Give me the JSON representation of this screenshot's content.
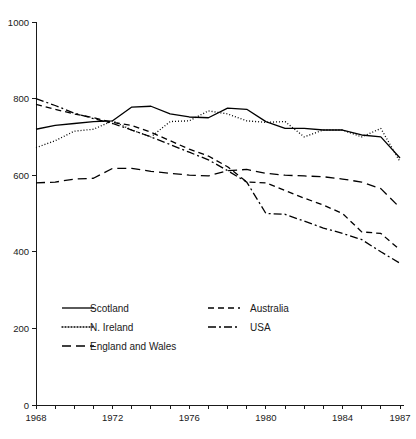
{
  "chart_data": {
    "type": "line",
    "title": "",
    "xlabel": "",
    "ylabel": "",
    "xlim": [
      1968,
      1987
    ],
    "ylim": [
      0,
      1000
    ],
    "grid": false,
    "legend_position": "inside-bottom-left",
    "x": [
      1968,
      1969,
      1970,
      1971,
      1972,
      1973,
      1974,
      1975,
      1976,
      1977,
      1978,
      1979,
      1980,
      1981,
      1982,
      1983,
      1984,
      1985,
      1986,
      1987
    ],
    "xticks": [
      1968,
      1969,
      1970,
      1971,
      1972,
      1973,
      1974,
      1975,
      1976,
      1977,
      1978,
      1979,
      1980,
      1981,
      1982,
      1983,
      1984,
      1985,
      1986,
      1987
    ],
    "xtick_labels": [
      "1968",
      "",
      "",
      "",
      "1972",
      "",
      "",
      "",
      "1976",
      "",
      "",
      "",
      "1980",
      "",
      "",
      "",
      "1984",
      "",
      "",
      "1987"
    ],
    "yticks": [
      0,
      200,
      400,
      600,
      800,
      1000
    ],
    "ytick_labels": [
      "0",
      "200",
      "400",
      "600",
      "800",
      "1000"
    ],
    "series": [
      {
        "name": "Scotland",
        "style": "solid",
        "values": [
          720,
          730,
          735,
          740,
          742,
          778,
          780,
          760,
          752,
          750,
          775,
          772,
          740,
          722,
          722,
          718,
          718,
          705,
          700,
          645
        ]
      },
      {
        "name": "N. Ireland",
        "style": "dotted",
        "values": [
          672,
          690,
          715,
          720,
          742,
          718,
          700,
          740,
          742,
          768,
          760,
          742,
          738,
          740,
          700,
          718,
          718,
          700,
          722,
          635
        ]
      },
      {
        "name": "England and Wales",
        "style": "long-dashed",
        "values": [
          580,
          582,
          590,
          592,
          618,
          618,
          610,
          605,
          600,
          598,
          612,
          615,
          605,
          600,
          598,
          596,
          590,
          582,
          565,
          515
        ]
      },
      {
        "name": "Australia",
        "style": "dashed",
        "values": [
          785,
          772,
          760,
          750,
          738,
          730,
          712,
          690,
          668,
          650,
          622,
          582,
          580,
          560,
          540,
          522,
          500,
          452,
          448,
          405
        ]
      },
      {
        "name": "USA",
        "style": "dash-dot",
        "values": [
          800,
          782,
          762,
          748,
          735,
          718,
          700,
          680,
          660,
          640,
          612,
          582,
          500,
          498,
          480,
          462,
          448,
          432,
          400,
          370
        ]
      }
    ]
  },
  "legend": {
    "entries": [
      {
        "label": "Scotland"
      },
      {
        "label": "N. Ireland"
      },
      {
        "label": "England and Wales"
      },
      {
        "label": "Australia"
      },
      {
        "label": "USA"
      }
    ]
  }
}
